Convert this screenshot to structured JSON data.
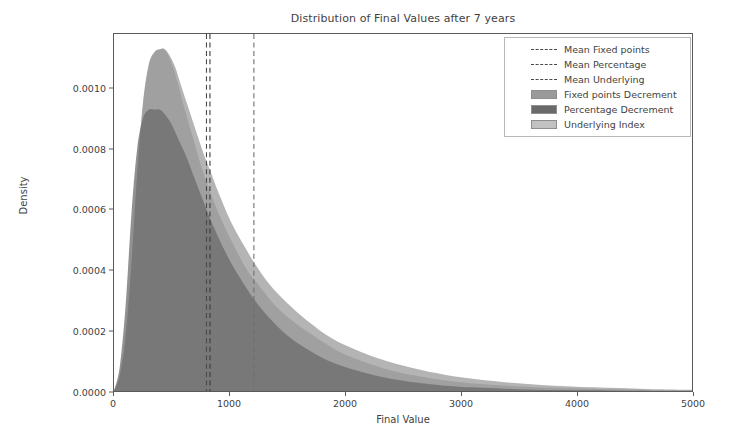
{
  "chart_data": {
    "type": "area",
    "title": "Distribution of Final Values after 7 years",
    "xlabel": "Final Value",
    "ylabel": "Density",
    "xlim": [
      0,
      5000
    ],
    "ylim": [
      0,
      0.00118
    ],
    "grid": false,
    "legend_position": "upper right",
    "xticks": [
      {
        "value": 0,
        "label": "0"
      },
      {
        "value": 1000,
        "label": "1000"
      },
      {
        "value": 2000,
        "label": "2000"
      },
      {
        "value": 3000,
        "label": "3000"
      },
      {
        "value": 4000,
        "label": "4000"
      },
      {
        "value": 5000,
        "label": "5000"
      }
    ],
    "yticks": [
      {
        "value": 0.0,
        "label": "0.0000"
      },
      {
        "value": 0.0002,
        "label": "0.0002"
      },
      {
        "value": 0.0004,
        "label": "0.0004"
      },
      {
        "value": 0.0006,
        "label": "0.0006"
      },
      {
        "value": 0.0008,
        "label": "0.0008"
      },
      {
        "value": 0.001,
        "label": "0.0010"
      }
    ],
    "series": [
      {
        "name": "Fixed points Decrement",
        "color": "#9a9a9a",
        "peak_x": 430,
        "peak_y": 0.00113,
        "x": [
          0,
          50,
          100,
          150,
          200,
          250,
          300,
          350,
          400,
          430,
          470,
          520,
          570,
          620,
          680,
          740,
          800,
          880,
          960,
          1050,
          1150,
          1250,
          1400,
          1550,
          1700,
          1900,
          2100,
          2350,
          2600,
          2900,
          3200,
          3600,
          4000,
          4500,
          5000
        ],
        "y": [
          0.0,
          5e-05,
          0.00018,
          0.00042,
          0.00072,
          0.00095,
          0.00108,
          0.00112,
          0.00113,
          0.00113,
          0.00111,
          0.00106,
          0.00099,
          0.00092,
          0.00084,
          0.00076,
          0.00069,
          0.00061,
          0.00054,
          0.00047,
          0.0004,
          0.00035,
          0.00028,
          0.00023,
          0.00019,
          0.00014,
          0.000105,
          7.3e-05,
          5.1e-05,
          3.3e-05,
          2.2e-05,
          1.3e-05,
          8e-06,
          4e-06,
          2e-06
        ]
      },
      {
        "name": "Percentage Decrement",
        "color": "#6a6a6a",
        "peak_x": 400,
        "peak_y": 0.00093,
        "x": [
          0,
          50,
          100,
          150,
          200,
          250,
          300,
          350,
          400,
          450,
          500,
          560,
          620,
          680,
          750,
          820,
          900,
          990,
          1080,
          1180,
          1300,
          1450,
          1600,
          1800,
          2000,
          2250,
          2500,
          2800,
          3100,
          3500,
          3900,
          4400,
          5000
        ],
        "y": [
          0.0,
          8e-05,
          0.00028,
          0.00058,
          0.0008,
          0.0009,
          0.00093,
          0.00093,
          0.00093,
          0.00091,
          0.00088,
          0.00083,
          0.00078,
          0.00072,
          0.00065,
          0.00058,
          0.00051,
          0.00044,
          0.00038,
          0.00032,
          0.00026,
          0.0002,
          0.000155,
          0.00011,
          7.9e-05,
          5.2e-05,
          3.4e-05,
          2e-05,
          1.2e-05,
          6e-06,
          3e-06,
          1.2e-06,
          4e-07
        ]
      },
      {
        "name": "Underlying Index",
        "color": "#b4b4b4",
        "peak_x": 440,
        "peak_y": 0.00113,
        "x": [
          0,
          50,
          100,
          150,
          200,
          250,
          300,
          350,
          400,
          440,
          480,
          530,
          580,
          640,
          700,
          770,
          840,
          920,
          1010,
          1110,
          1220,
          1350,
          1500,
          1680,
          1880,
          2100,
          2350,
          2650,
          2950,
          3300,
          3700,
          4150,
          4600,
          5000
        ],
        "y": [
          0.0,
          5e-05,
          0.00017,
          0.0004,
          0.0007,
          0.00094,
          0.00107,
          0.00112,
          0.00113,
          0.00113,
          0.00111,
          0.00107,
          0.00101,
          0.00094,
          0.00087,
          0.00079,
          0.00072,
          0.00064,
          0.00056,
          0.00049,
          0.00042,
          0.00035,
          0.00029,
          0.00023,
          0.000175,
          0.000135,
          0.0001,
          7e-05,
          4.8e-05,
          3.2e-05,
          2e-05,
          1.2e-05,
          7e-06,
          4e-06
        ]
      }
    ],
    "vlines": [
      {
        "name": "Mean Fixed points",
        "value": 800,
        "color": "#4a4a4a",
        "style": "dashed"
      },
      {
        "name": "Mean Percentage",
        "value": 830,
        "color": "#3a3a3a",
        "style": "dashed"
      },
      {
        "name": "Mean Underlying",
        "value": 1210,
        "color": "#707070",
        "style": "dashed"
      }
    ]
  },
  "legend": {
    "entries": [
      {
        "label": "Mean Fixed points",
        "kind": "dashline",
        "color": "#4a4a4a"
      },
      {
        "label": "Mean Percentage",
        "kind": "dashline",
        "color": "#3a3a3a"
      },
      {
        "label": "Mean Underlying",
        "kind": "dashline",
        "color": "#707070"
      },
      {
        "label": "Fixed points Decrement",
        "kind": "patch",
        "color": "#9a9a9a"
      },
      {
        "label": "Percentage Decrement",
        "kind": "patch",
        "color": "#6a6a6a"
      },
      {
        "label": "Underlying Index",
        "kind": "patch",
        "color": "#c2c2c2"
      }
    ]
  }
}
